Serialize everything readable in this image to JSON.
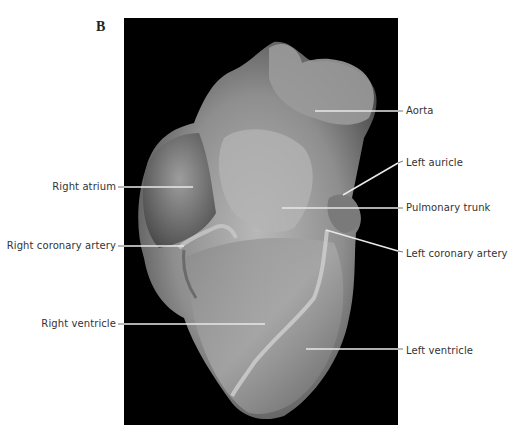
{
  "figure": {
    "panel_letter": "B"
  },
  "labels": {
    "right": [
      {
        "id": "aorta",
        "text": "Aorta"
      },
      {
        "id": "left-auricle",
        "text": "Left auricle"
      },
      {
        "id": "pulmonary-trunk",
        "text": "Pulmonary trunk"
      },
      {
        "id": "left-coronary-artery",
        "text": "Left coronary artery"
      },
      {
        "id": "left-ventricle",
        "text": "Left ventricle"
      }
    ],
    "left": [
      {
        "id": "right-atrium",
        "text": "Right atrium"
      },
      {
        "id": "right-coronary-artery",
        "text": "Right coronary artery"
      },
      {
        "id": "right-ventricle",
        "text": "Right ventricle"
      }
    ]
  },
  "colors": {
    "background": "#ffffff",
    "photo_background": "#000000",
    "leader_line": "#e8e8e8",
    "label_text": "#333333"
  }
}
